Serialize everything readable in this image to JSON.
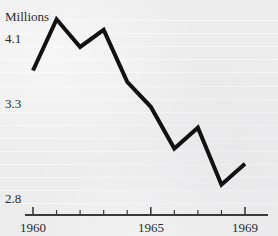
{
  "chart_data": {
    "type": "line",
    "title": "",
    "subtitle": "",
    "ylabel": "Millions",
    "xlabel": "",
    "x": [
      1960,
      1961,
      1962,
      1963,
      1964,
      1965,
      1966,
      1967,
      1968,
      1969
    ],
    "values": [
      3.7,
      4.33,
      3.99,
      4.2,
      3.56,
      3.28,
      3.06,
      3.17,
      2.87,
      2.98
    ],
    "series": [
      {
        "name": "Millions",
        "values": [
          3.7,
          4.33,
          3.99,
          4.2,
          3.56,
          3.28,
          3.06,
          3.17,
          2.87,
          2.98
        ]
      }
    ],
    "ytick_labels": [
      "4.1",
      "3.3",
      "2.8"
    ],
    "ytick_values": [
      4.1,
      3.3,
      2.8
    ],
    "xtick_labels": [
      "1960",
      "1965",
      "1969"
    ],
    "xtick_values": [
      1960,
      1965,
      1969
    ],
    "xtick_all": [
      1960,
      1961,
      1962,
      1963,
      1964,
      1965,
      1966,
      1967,
      1968,
      1969
    ],
    "xlim": [
      1960,
      1969
    ],
    "grid": "horizontal",
    "legend": "none",
    "line_color": "#111111",
    "line_width": 4,
    "background_color": "#ececed",
    "gridline_color": "#f7f7f8",
    "axis_color": "#3a3a3a",
    "text_color": "#2a2a2a"
  },
  "labels": {
    "y_axis_title": "Millions",
    "y_tick_top": "4.1",
    "y_tick_mid": "3.3",
    "y_tick_bottom": "2.8",
    "x_tick_start": "1960",
    "x_tick_mid": "1965",
    "x_tick_end": "1969"
  }
}
